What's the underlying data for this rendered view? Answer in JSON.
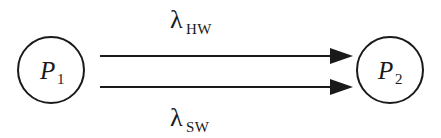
{
  "diagram": {
    "background_color": "#ffffff",
    "stroke_color": "#1a1a1a",
    "states": [
      {
        "id": "p1",
        "symbol": "P",
        "subscript": "1",
        "cx": 51,
        "cy": 70,
        "r": 33
      },
      {
        "id": "p2",
        "symbol": "P",
        "subscript": "2",
        "cx": 390,
        "cy": 70,
        "r": 33
      }
    ],
    "transitions": [
      {
        "id": "hw",
        "symbol": "λ",
        "subscript": "HW",
        "from": "p1",
        "to": "p2",
        "label_x": 170,
        "label_y": 28,
        "line_y": 56,
        "line_x1": 100,
        "line_x2": 330,
        "tip_x": 353
      },
      {
        "id": "sw",
        "symbol": "λ",
        "subscript": "SW",
        "from": "p1",
        "to": "p2",
        "label_x": 170,
        "label_y": 126,
        "line_y": 87,
        "line_x1": 100,
        "line_x2": 330,
        "tip_x": 353
      }
    ]
  }
}
